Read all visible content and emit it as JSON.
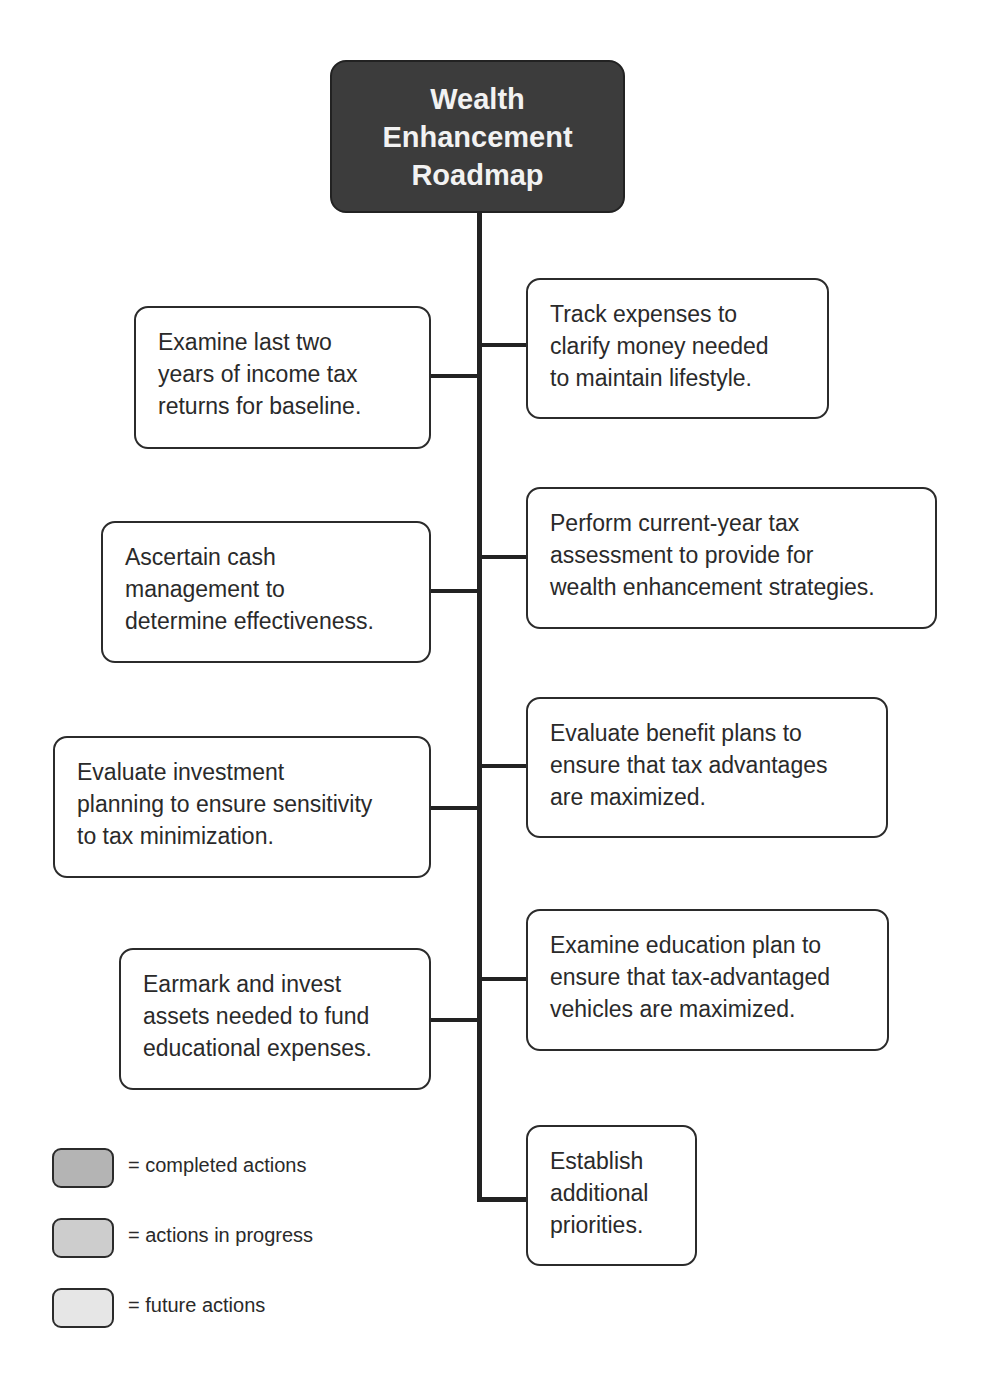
{
  "diagram": {
    "title": "Wealth\nEnhancement\nRoadmap",
    "left_steps": [
      {
        "text": "Examine last two\nyears of income tax\nreturns for baseline."
      },
      {
        "text": "Ascertain cash\nmanagement to\ndetermine effectiveness."
      },
      {
        "text": "Evaluate investment\nplanning to ensure sensitivity\nto tax minimization."
      },
      {
        "text": "Earmark and invest\nassets needed to fund\neducational expenses."
      }
    ],
    "right_steps": [
      {
        "text": "Track expenses to\nclarify money needed\nto maintain lifestyle."
      },
      {
        "text": "Perform current-year tax\nassessment to provide for\nwealth enhancement strategies."
      },
      {
        "text": "Evaluate benefit plans to\nensure that tax advantages\nare maximized."
      },
      {
        "text": "Examine education plan to\nensure that tax-advantaged\nvehicles are maximized."
      },
      {
        "text": "Establish\nadditional\npriorities."
      }
    ]
  },
  "legend": [
    {
      "label": "= completed actions",
      "color": "#b4b4b4"
    },
    {
      "label": "= actions in progress",
      "color": "#cdcdcd"
    },
    {
      "label": "= future actions",
      "color": "#e6e6e6"
    }
  ],
  "colors": {
    "title_fill": "#3c3c3c",
    "title_text": "#f2f2f2",
    "box_fill": "#ffffff",
    "border": "#2b2b2b"
  }
}
